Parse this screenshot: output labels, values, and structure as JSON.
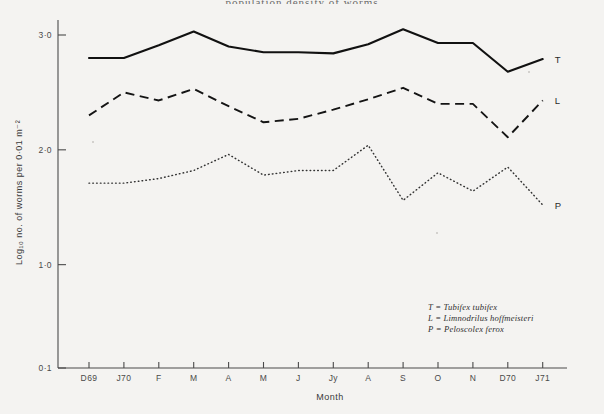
{
  "figure": {
    "background_color": "#f4f3f1",
    "ink_color": "#1a1a1a",
    "top_title_fragment": "population density of worms"
  },
  "axes": {
    "y_axis_title": "Log₁₀ no. of worms per 0·01 m⁻²",
    "x_axis_title": "Month",
    "y_tick_labels": [
      "3·0",
      "2·0",
      "1·0",
      "0·1"
    ],
    "y_tick_values": [
      3.0,
      2.0,
      1.0,
      0.1
    ],
    "x_tick_labels": [
      "D69",
      "J70",
      "F",
      "M",
      "A",
      "M",
      "J",
      "Jy",
      "A",
      "S",
      "O",
      "N",
      "D70",
      "J71"
    ]
  },
  "series_end_labels": {
    "t": "T",
    "l": "L",
    "p": "P"
  },
  "legend": {
    "lines": [
      "T = Tubifex tubifex",
      "L = Limnodrilus hoffmeisteri",
      "P = Peloscolex ferox"
    ]
  },
  "chart_data": {
    "type": "line",
    "title": "Population density of worms",
    "xlabel": "Month",
    "ylabel": "Log₁₀ no. of worms per 0·01 m⁻²",
    "x": [
      "D69",
      "J70",
      "F",
      "M",
      "A",
      "M",
      "J",
      "Jy",
      "A",
      "S",
      "O",
      "N",
      "D70",
      "J71"
    ],
    "xlim": [
      0,
      13
    ],
    "ylim": [
      0.1,
      3.0
    ],
    "grid": false,
    "legend_position": "right-of-line-ends",
    "y_tick_values": [
      0.1,
      1.0,
      2.0,
      3.0
    ],
    "y_tick_labels": [
      "0·1",
      "1·0",
      "2·0",
      "3·0"
    ],
    "series": [
      {
        "name": "T = Tubifex tubifex",
        "short": "T",
        "linestyle": "solid",
        "color": "#111111",
        "values": [
          2.8,
          2.8,
          2.91,
          3.03,
          2.9,
          2.85,
          2.85,
          2.84,
          2.92,
          3.05,
          2.93,
          2.93,
          2.68,
          2.79
        ]
      },
      {
        "name": "L = Limnodrilus hoffmeisteri",
        "short": "L",
        "linestyle": "dashed",
        "color": "#141414",
        "values": [
          2.3,
          2.5,
          2.43,
          2.53,
          2.38,
          2.24,
          2.27,
          2.35,
          2.44,
          2.54,
          2.4,
          2.4,
          2.11,
          2.43
        ]
      },
      {
        "name": "P = Peloscolex ferox",
        "short": "P",
        "linestyle": "dotted",
        "color": "#333333",
        "values": [
          1.71,
          1.71,
          1.75,
          1.82,
          1.96,
          1.78,
          1.82,
          1.82,
          2.04,
          1.56,
          1.8,
          1.64,
          1.85,
          1.52
        ]
      }
    ]
  }
}
